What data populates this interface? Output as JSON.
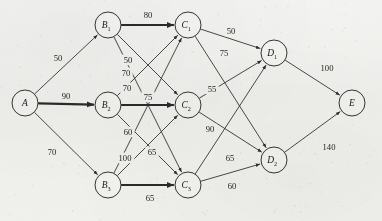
{
  "diagram": {
    "type": "directed-weighted-graph",
    "background_color": "#f4f4f2",
    "stroke_color": "#2b2b2b",
    "nodes": [
      {
        "id": "A",
        "label": "A",
        "sub": "",
        "x": 25,
        "y": 103,
        "r": 13
      },
      {
        "id": "B1",
        "label": "B",
        "sub": "1",
        "x": 108,
        "y": 25,
        "r": 13
      },
      {
        "id": "B2",
        "label": "B",
        "sub": "2",
        "x": 108,
        "y": 105,
        "r": 13
      },
      {
        "id": "B3",
        "label": "B",
        "sub": "3",
        "x": 108,
        "y": 185,
        "r": 13
      },
      {
        "id": "C1",
        "label": "C",
        "sub": "1",
        "x": 188,
        "y": 25,
        "r": 13
      },
      {
        "id": "C2",
        "label": "C",
        "sub": "2",
        "x": 188,
        "y": 105,
        "r": 13
      },
      {
        "id": "C3",
        "label": "C",
        "sub": "3",
        "x": 188,
        "y": 185,
        "r": 13
      },
      {
        "id": "D1",
        "label": "D",
        "sub": "1",
        "x": 274,
        "y": 53,
        "r": 13
      },
      {
        "id": "D2",
        "label": "D",
        "sub": "2",
        "x": 274,
        "y": 160,
        "r": 13
      },
      {
        "id": "E",
        "label": "E",
        "sub": "",
        "x": 352,
        "y": 103,
        "r": 13
      }
    ],
    "edges": [
      {
        "from": "A",
        "to": "B1",
        "weight": "50",
        "lx": 58,
        "ly": 58,
        "thick": false
      },
      {
        "from": "A",
        "to": "B2",
        "weight": "90",
        "lx": 66,
        "ly": 96,
        "thick": true
      },
      {
        "from": "A",
        "to": "B3",
        "weight": "70",
        "lx": 52,
        "ly": 152,
        "thick": false
      },
      {
        "from": "B1",
        "to": "C1",
        "weight": "80",
        "lx": 148,
        "ly": 15,
        "thick": true
      },
      {
        "from": "B1",
        "to": "C2",
        "weight": "50",
        "lx": 128,
        "ly": 60,
        "thick": false
      },
      {
        "from": "B1",
        "to": "C3",
        "weight": "60",
        "lx": 128,
        "ly": 132,
        "thick": false
      },
      {
        "from": "B2",
        "to": "C1",
        "weight": "70",
        "lx": 127,
        "ly": 88,
        "thick": false
      },
      {
        "from": "B2",
        "to": "C2",
        "weight": "75",
        "lx": 148,
        "ly": 97,
        "thick": true
      },
      {
        "from": "B2",
        "to": "C3",
        "weight": "65",
        "lx": 152,
        "ly": 152,
        "thick": false
      },
      {
        "from": "B3",
        "to": "C1",
        "weight": "70",
        "lx": 126,
        "ly": 73,
        "thick": false
      },
      {
        "from": "B3",
        "to": "C2",
        "weight": "100",
        "lx": 125,
        "ly": 158,
        "thick": false
      },
      {
        "from": "B3",
        "to": "C3",
        "weight": "65",
        "lx": 150,
        "ly": 198,
        "thick": true
      },
      {
        "from": "C1",
        "to": "D1",
        "weight": "50",
        "lx": 231,
        "ly": 31,
        "thick": false
      },
      {
        "from": "C1",
        "to": "D2",
        "weight": "90",
        "lx": 210,
        "ly": 129,
        "thick": false
      },
      {
        "from": "C2",
        "to": "D1",
        "weight": "75",
        "lx": 224,
        "ly": 53,
        "thick": false
      },
      {
        "from": "C2",
        "to": "D2",
        "weight": "65",
        "lx": 230,
        "ly": 158,
        "thick": false
      },
      {
        "from": "C3",
        "to": "D1",
        "weight": "55",
        "lx": 212,
        "ly": 89,
        "thick": false
      },
      {
        "from": "C3",
        "to": "D2",
        "weight": "60",
        "lx": 232,
        "ly": 186,
        "thick": false
      },
      {
        "from": "D1",
        "to": "E",
        "weight": "100",
        "lx": 327,
        "ly": 68,
        "thick": false
      },
      {
        "from": "D2",
        "to": "E",
        "weight": "140",
        "lx": 329,
        "ly": 147,
        "thick": false
      }
    ]
  }
}
